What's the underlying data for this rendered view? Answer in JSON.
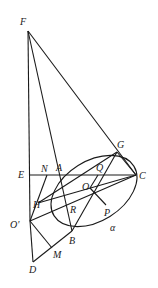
{
  "diagram": {
    "type": "geometry-figure",
    "points": {
      "F": {
        "label": "F",
        "x": 28,
        "y": 31
      },
      "E": {
        "label": "E",
        "x": 30,
        "y": 175
      },
      "N": {
        "label": "N",
        "x": 47,
        "y": 175
      },
      "A": {
        "label": "A",
        "x": 59,
        "y": 175
      },
      "G": {
        "label": "G",
        "x": 117,
        "y": 152
      },
      "C": {
        "label": "C",
        "x": 136,
        "y": 175
      },
      "Q": {
        "label": "Q",
        "x": 98,
        "y": 175
      },
      "O": {
        "label": "O",
        "x": 90,
        "y": 188
      },
      "H": {
        "label": "H",
        "x": 38,
        "y": 203
      },
      "R": {
        "label": "R",
        "x": 66,
        "y": 200
      },
      "P": {
        "label": "P",
        "x": 104,
        "y": 205
      },
      "O_prime": {
        "label": "O'",
        "x": 30,
        "y": 221
      },
      "B": {
        "label": "B",
        "x": 72,
        "y": 231
      },
      "M": {
        "label": "M",
        "x": 52,
        "y": 248
      },
      "D": {
        "label": "D",
        "x": 33,
        "y": 262
      }
    },
    "plane_label": "α",
    "label_positions": {
      "F": [
        20,
        25
      ],
      "E": [
        18,
        178
      ],
      "N": [
        41,
        172
      ],
      "A": [
        55,
        170
      ],
      "G": [
        117,
        147
      ],
      "C": [
        140,
        179
      ],
      "Q": [
        96,
        170
      ],
      "O": [
        84,
        188
      ],
      "H": [
        33,
        207
      ],
      "R": [
        70,
        213
      ],
      "P": [
        104,
        215
      ],
      "O_prime": [
        10,
        228
      ],
      "B": [
        69,
        243
      ],
      "M": [
        52,
        257
      ],
      "D": [
        30,
        272
      ],
      "alpha": [
        111,
        230
      ]
    },
    "segments": [
      [
        "F",
        "O_prime"
      ],
      [
        "F",
        "A"
      ],
      [
        "F",
        "C"
      ],
      [
        "E",
        "C"
      ],
      [
        "A",
        "B"
      ],
      [
        "G",
        "C"
      ],
      [
        "G",
        "H"
      ],
      [
        "H",
        "C"
      ],
      [
        "O_prime",
        "C"
      ],
      [
        "O_prime",
        "D"
      ],
      [
        "D",
        "B"
      ],
      [
        "B",
        "G"
      ],
      [
        "O",
        "P"
      ],
      [
        "O",
        "Q"
      ],
      [
        "O_prime",
        "M"
      ],
      [
        "O_prime",
        "N"
      ]
    ],
    "ellipse": {
      "cx": 96,
      "cy": 192,
      "rx": 46,
      "ry": 30,
      "rotate": -30
    }
  }
}
